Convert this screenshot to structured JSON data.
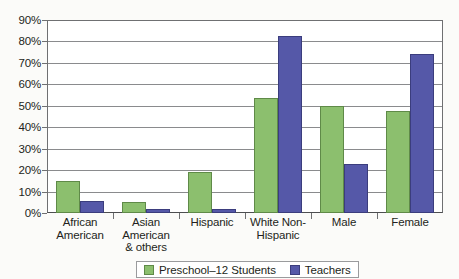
{
  "chart_data": {
    "type": "bar",
    "title": "",
    "xlabel": "",
    "ylabel": "",
    "ylim": [
      0,
      90
    ],
    "grid": true,
    "legend_position": "bottom",
    "categories": [
      "African\nAmerican",
      "Asian\nAmerican\n& others",
      "Hispanic",
      "White Non-\nHispanic",
      "Male",
      "Female"
    ],
    "y_ticks": [
      "0%",
      "10%",
      "20%",
      "30%",
      "40%",
      "50%",
      "60%",
      "70%",
      "80%",
      "90%"
    ],
    "series": [
      {
        "name": "Preschool–12 Students",
        "color": "#8CBF6E",
        "values": [
          15,
          5,
          19,
          54,
          50,
          48
        ]
      },
      {
        "name": "Teachers",
        "color": "#5558A8",
        "values": [
          5.5,
          2,
          2,
          83,
          23,
          74.5
        ]
      }
    ]
  },
  "axis": {
    "y_tick_labels": [
      "90%",
      "80%",
      "70%",
      "60%",
      "50%",
      "40%",
      "30%",
      "20%",
      "10%",
      "0%"
    ],
    "x_category_lines": [
      [
        "African",
        "American"
      ],
      [
        "Asian",
        "American",
        "& others"
      ],
      [
        "Hispanic"
      ],
      [
        "White Non-",
        "Hispanic"
      ],
      [
        "Male"
      ],
      [
        "Female"
      ]
    ]
  },
  "legend": {
    "entries": [
      {
        "label": "Preschool–12 Students",
        "swatch": "green-swatch"
      },
      {
        "label": "Teachers",
        "swatch": "blue-swatch"
      }
    ]
  }
}
